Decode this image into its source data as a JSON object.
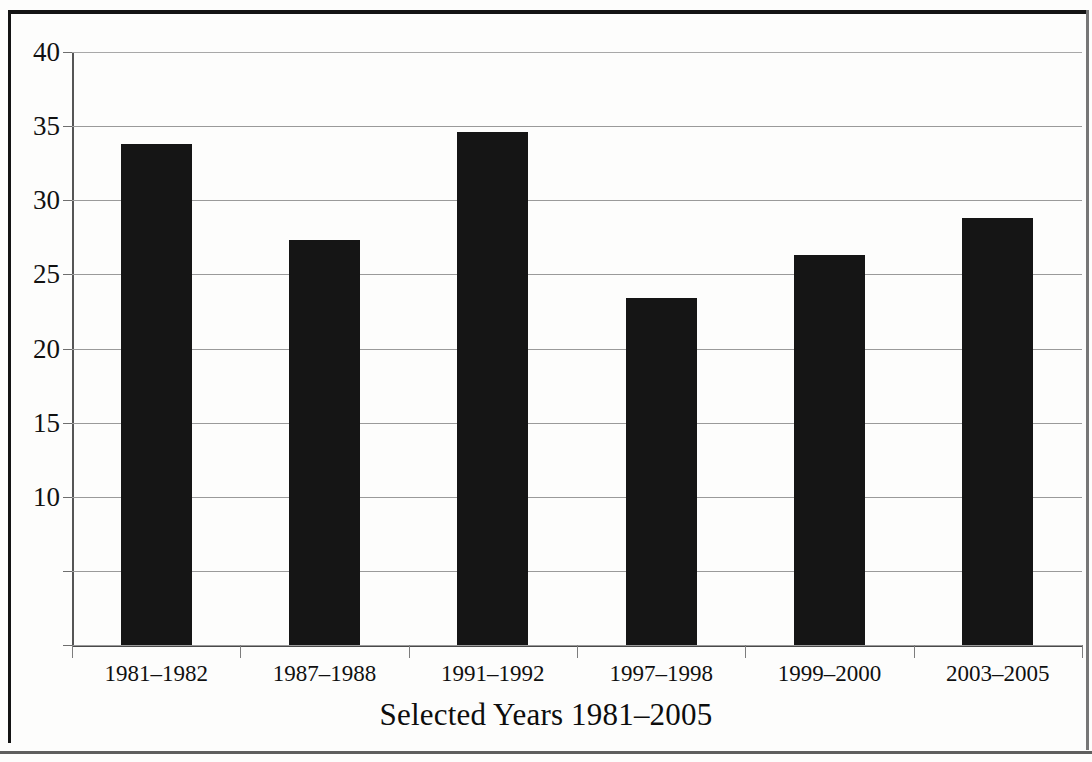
{
  "figure": {
    "background_color": "#fdfdfc",
    "frame_color": "#141414",
    "bar_color": "#151515",
    "gridline_color": "#9a9a9a",
    "axis_color": "#4a4a4a"
  },
  "chart_data": {
    "type": "bar",
    "title": "",
    "subtitle": "",
    "xlabel": "Selected Years 1981–2005",
    "ylabel": "",
    "categories": [
      "1981–1982",
      "1987–1988",
      "1991–1992",
      "1997–1998",
      "1999–2000",
      "2003–2005"
    ],
    "values": [
      33.8,
      27.3,
      34.6,
      23.4,
      26.3,
      28.8
    ],
    "series": [
      {
        "name": "",
        "values": [
          33.8,
          27.3,
          34.6,
          23.4,
          26.3,
          28.8
        ]
      }
    ],
    "ylim": [
      0,
      40
    ],
    "xlim": [
      0,
      6
    ],
    "y_ticks": [
      0,
      5,
      10,
      15,
      20,
      25,
      30,
      35,
      40
    ],
    "y_tick_labels": [
      "",
      "",
      "10",
      "15",
      "20",
      "25",
      "30",
      "35",
      "40"
    ],
    "grid": true,
    "grid_axis": "y",
    "legend": false,
    "legend_position": "none",
    "annotations": [],
    "bar_orientation": "vertical"
  }
}
